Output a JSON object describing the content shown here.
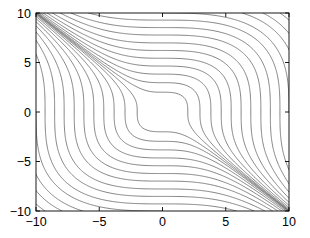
{
  "figure": {
    "background_color": "#ffffff",
    "width": 310,
    "height": 238
  },
  "axes": {
    "box_color": "#000000",
    "box_line_width": 0.9,
    "left_px": 36,
    "top_px": 13,
    "right_px": 289,
    "bottom_px": 211,
    "tick_length_px": 4,
    "tick_direction": "in"
  },
  "chart_data": {
    "type": "line",
    "plot_kind": "contour",
    "title": "",
    "xlabel": "",
    "ylabel": "",
    "xlim": [
      -10,
      10
    ],
    "ylim": [
      -10,
      10
    ],
    "grid": false,
    "legend": null,
    "legend_position": "none",
    "line_color": "#5a5a5a",
    "line_width": 0.75,
    "x_ticks": [
      -10,
      -5,
      0,
      5,
      10
    ],
    "y_ticks": [
      -10,
      -5,
      0,
      5,
      10
    ],
    "x_tick_labels": [
      "-10",
      "-5",
      "0",
      "5",
      "10"
    ],
    "y_tick_labels": [
      "-10",
      "-5",
      "0",
      "5",
      "10"
    ],
    "function_form": "z = x^3 + y^3",
    "contour_levels": [
      -1800,
      -1500,
      -1250,
      -1000,
      -800,
      -620,
      -470,
      -340,
      -240,
      -160,
      -100,
      -56,
      -26,
      -8,
      8,
      26,
      56,
      100,
      160,
      240,
      340,
      470,
      620,
      800,
      1000,
      1250,
      1500,
      1800
    ],
    "contour_level_count": 28,
    "series": [
      {
        "name": "contour lines",
        "values": [
          -1800,
          -1500,
          -1250,
          -1000,
          -800,
          -620,
          -470,
          -340,
          -240,
          -160,
          -100,
          -56,
          -26,
          -8,
          8,
          26,
          56,
          100,
          160,
          240,
          340,
          470,
          620,
          800,
          1000,
          1250,
          1500,
          1800
        ]
      }
    ]
  }
}
